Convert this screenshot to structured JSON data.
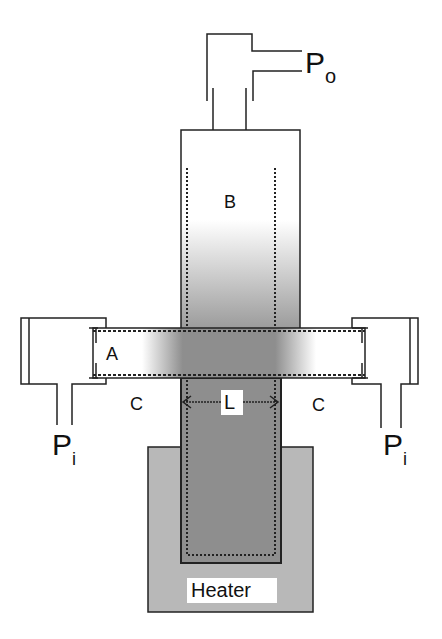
{
  "diagram": {
    "labels": {
      "outlet_pressure": "P",
      "outlet_pressure_sub": "o",
      "inlet_pressure_left": "P",
      "inlet_pressure_left_sub": "i",
      "inlet_pressure_right": "P",
      "inlet_pressure_right_sub": "i",
      "region_a": "A",
      "region_b": "B",
      "region_c_left": "C",
      "region_c_right": "C",
      "length": "L",
      "heater": "Heater"
    },
    "colors": {
      "line": "#222222",
      "heater_fill": "#b8b8b8",
      "heated_zone_fill": "#8e8e8e",
      "background": "#ffffff"
    }
  }
}
